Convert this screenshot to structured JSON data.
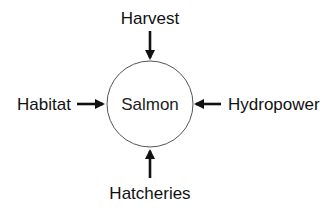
{
  "diagram": {
    "center": {
      "label": "Salmon",
      "shape": "circle"
    },
    "influences": [
      {
        "id": "harvest",
        "label": "Harvest",
        "direction": "top",
        "arrow": "into-center"
      },
      {
        "id": "habitat",
        "label": "Habitat",
        "direction": "left",
        "arrow": "into-center"
      },
      {
        "id": "hydropower",
        "label": "Hydropower",
        "direction": "right",
        "arrow": "into-center"
      },
      {
        "id": "hatcheries",
        "label": "Hatcheries",
        "direction": "bottom",
        "arrow": "into-center"
      }
    ],
    "colors": {
      "background": "#ffffff",
      "text": "#111111",
      "arrow": "#111111",
      "circle_stroke": "#555555"
    }
  }
}
